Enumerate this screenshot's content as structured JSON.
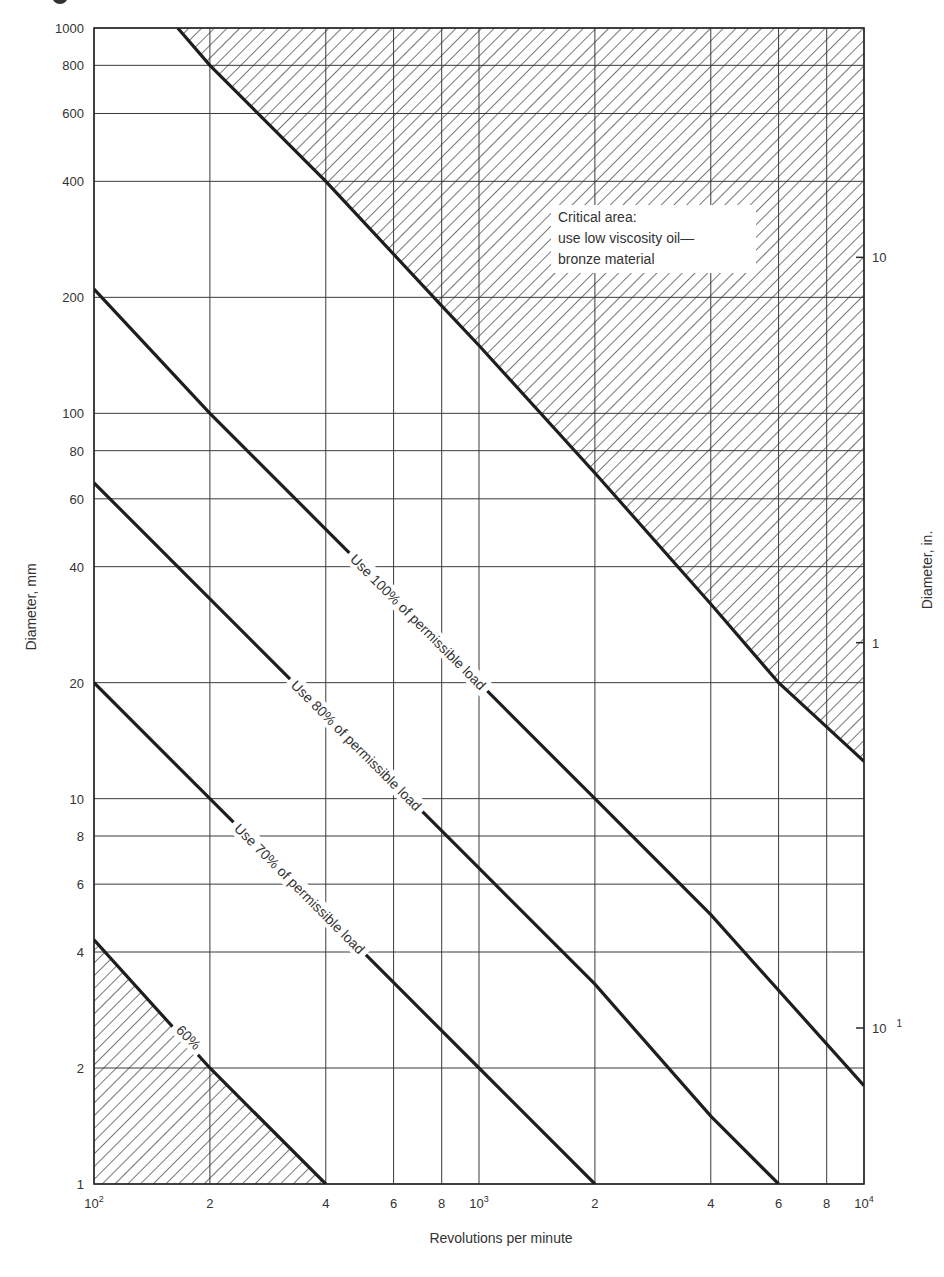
{
  "chart_data": {
    "type": "line",
    "title": "",
    "xlabel": "Revolutions per minute",
    "ylabel": "Diameter, mm",
    "ylabel_right": "Diameter, in.",
    "xscale": "log",
    "yscale": "log",
    "xlim": [
      100,
      10000
    ],
    "ylim": [
      1,
      1000
    ],
    "grid": true,
    "x_ticks": [
      {
        "value": 100,
        "label": "10",
        "sup": "2"
      },
      {
        "value": 200,
        "label": "2"
      },
      {
        "value": 400,
        "label": "4"
      },
      {
        "value": 600,
        "label": "6"
      },
      {
        "value": 800,
        "label": "8"
      },
      {
        "value": 1000,
        "label": "10",
        "sup": "3"
      },
      {
        "value": 2000,
        "label": "2"
      },
      {
        "value": 4000,
        "label": "4"
      },
      {
        "value": 6000,
        "label": "6"
      },
      {
        "value": 8000,
        "label": "8"
      },
      {
        "value": 10000,
        "label": "10",
        "sup": "4"
      }
    ],
    "y_ticks": [
      {
        "value": 1000,
        "label": "1000"
      },
      {
        "value": 800,
        "label": "800"
      },
      {
        "value": 600,
        "label": "600"
      },
      {
        "value": 400,
        "label": "400"
      },
      {
        "value": 200,
        "label": "200"
      },
      {
        "value": 100,
        "label": "100"
      },
      {
        "value": 80,
        "label": "80"
      },
      {
        "value": 60,
        "label": "60"
      },
      {
        "value": 40,
        "label": "40"
      },
      {
        "value": 20,
        "label": "20"
      },
      {
        "value": 10,
        "label": "10"
      },
      {
        "value": 8,
        "label": "8"
      },
      {
        "value": 6,
        "label": "6"
      },
      {
        "value": 4,
        "label": "4"
      },
      {
        "value": 2,
        "label": "2"
      },
      {
        "value": 1,
        "label": "1"
      }
    ],
    "y_ticks_right": [
      {
        "value_mm": 254,
        "label": "10"
      },
      {
        "value_mm": 25.4,
        "label": "1"
      },
      {
        "value_mm": 2.54,
        "label": "10",
        "sup": "1"
      }
    ],
    "series": [
      {
        "name": "Critical area boundary",
        "x": [
          165,
          200,
          400,
          800,
          1000,
          2000,
          4000,
          6000,
          10000
        ],
        "y": [
          1000,
          800,
          400,
          190,
          150,
          70,
          32,
          20,
          12.5
        ],
        "hatched_region": "above"
      },
      {
        "name": "Use 100% of permissible load",
        "x": [
          100,
          200,
          400,
          1000,
          2000,
          4000,
          10000
        ],
        "y": [
          210,
          100,
          50,
          20,
          10,
          5,
          1.8
        ]
      },
      {
        "name": "Use 80% of permissible load",
        "x": [
          100,
          200,
          400,
          1000,
          2000,
          4000,
          6000
        ],
        "y": [
          66,
          33,
          16.5,
          6.6,
          3.3,
          1.5,
          1
        ]
      },
      {
        "name": "Use 70% of permissible load",
        "x": [
          100,
          200,
          400,
          1000,
          2000
        ],
        "y": [
          20,
          10,
          5,
          2,
          1
        ]
      },
      {
        "name": "60%",
        "x": [
          100,
          200,
          400
        ],
        "y": [
          4.3,
          2,
          1
        ],
        "hatched_region": "below"
      }
    ],
    "annotations": [
      {
        "text": "Critical area:",
        "line": 1
      },
      {
        "text": "use low viscosity oil—",
        "line": 2
      },
      {
        "text": "bronze material",
        "line": 3
      }
    ]
  },
  "labels": {
    "xlabel": "Revolutions per minute",
    "ylabel": "Diameter, mm",
    "ylabel_right": "Diameter, in.",
    "critical_line1": "Critical area:",
    "critical_line2": "use low viscosity oil—",
    "critical_line3": "bronze material",
    "curve_100": "Use 100% of permissible load",
    "curve_80": "Use 80% of permissible load",
    "curve_70": "Use 70% of permissible load",
    "curve_60": "60%"
  }
}
